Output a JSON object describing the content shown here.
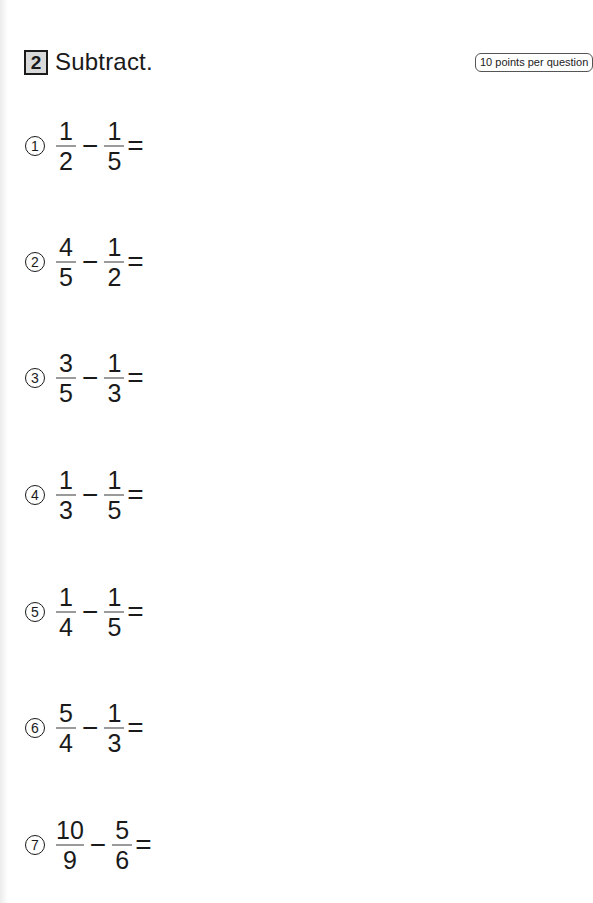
{
  "header": {
    "section_number": "2",
    "title": "Subtract.",
    "points_note": "10 points per question"
  },
  "problems": [
    {
      "label": "1",
      "a_num": "1",
      "a_den": "2",
      "op": "−",
      "b_num": "1",
      "b_den": "5",
      "eq": "="
    },
    {
      "label": "2",
      "a_num": "4",
      "a_den": "5",
      "op": "−",
      "b_num": "1",
      "b_den": "2",
      "eq": "="
    },
    {
      "label": "3",
      "a_num": "3",
      "a_den": "5",
      "op": "−",
      "b_num": "1",
      "b_den": "3",
      "eq": "="
    },
    {
      "label": "4",
      "a_num": "1",
      "a_den": "3",
      "op": "−",
      "b_num": "1",
      "b_den": "5",
      "eq": "="
    },
    {
      "label": "5",
      "a_num": "1",
      "a_den": "4",
      "op": "−",
      "b_num": "1",
      "b_den": "5",
      "eq": "="
    },
    {
      "label": "6",
      "a_num": "5",
      "a_den": "4",
      "op": "−",
      "b_num": "1",
      "b_den": "3",
      "eq": "="
    },
    {
      "label": "7",
      "a_num": "10",
      "a_den": "9",
      "op": "−",
      "b_num": "5",
      "b_den": "6",
      "eq": "="
    }
  ]
}
